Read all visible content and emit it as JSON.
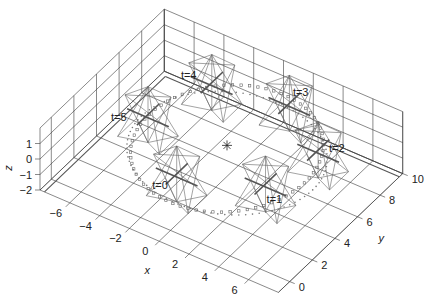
{
  "chart_data": {
    "type": "scatter",
    "subtype": "3d-trajectory",
    "title": "",
    "xlabel": "x",
    "ylabel": "y",
    "zlabel": "z",
    "xlim": [
      -8,
      8
    ],
    "ylim": [
      -1,
      10
    ],
    "zlim": [
      -2,
      2
    ],
    "xticks": [
      -6,
      -4,
      -2,
      0,
      2,
      4,
      6
    ],
    "yticks": [
      0,
      2,
      4,
      6,
      8,
      10
    ],
    "zticks": [
      -2,
      -1,
      0,
      1
    ],
    "grid": true,
    "center": {
      "x": 0,
      "y": 5,
      "z": 0,
      "marker": "asterisk"
    },
    "trajectory": {
      "radius": 5,
      "center_x": 0,
      "center_y": 5,
      "z": -0.5
    },
    "time_labels": [
      {
        "label": "t=0",
        "t": 0,
        "x": -1.0,
        "y": 0.4,
        "z": 0.0
      },
      {
        "label": "t=1",
        "t": 1,
        "x": 5.0,
        "y": 2.6,
        "z": 0.0
      },
      {
        "label": "t=2",
        "t": 2,
        "x": 5.4,
        "y": 7.6,
        "z": 0.0
      },
      {
        "label": "t=3",
        "t": 3,
        "x": 1.0,
        "y": 10.2,
        "z": 0.0
      },
      {
        "label": "t=4",
        "t": 4,
        "x": -5.0,
        "y": 8.2,
        "z": 0.0
      },
      {
        "label": "t=5",
        "t": 5,
        "x": -6.2,
        "y": 3.6,
        "z": 0.0
      }
    ],
    "frames": [
      {
        "t": 0,
        "x": -0.8,
        "y": 1.6,
        "z": 0.0,
        "size": 1.4
      },
      {
        "t": 1,
        "x": 3.8,
        "y": 3.4,
        "z": 0.0,
        "size": 1.4
      },
      {
        "t": 2,
        "x": 4.6,
        "y": 7.0,
        "z": 0.0,
        "size": 1.4
      },
      {
        "t": 3,
        "x": 1.0,
        "y": 9.2,
        "z": 0.0,
        "size": 1.4
      },
      {
        "t": 4,
        "x": -3.6,
        "y": 8.4,
        "z": 0.0,
        "size": 1.4
      },
      {
        "t": 5,
        "x": -5.0,
        "y": 4.6,
        "z": 0.0,
        "size": 1.4
      }
    ]
  }
}
